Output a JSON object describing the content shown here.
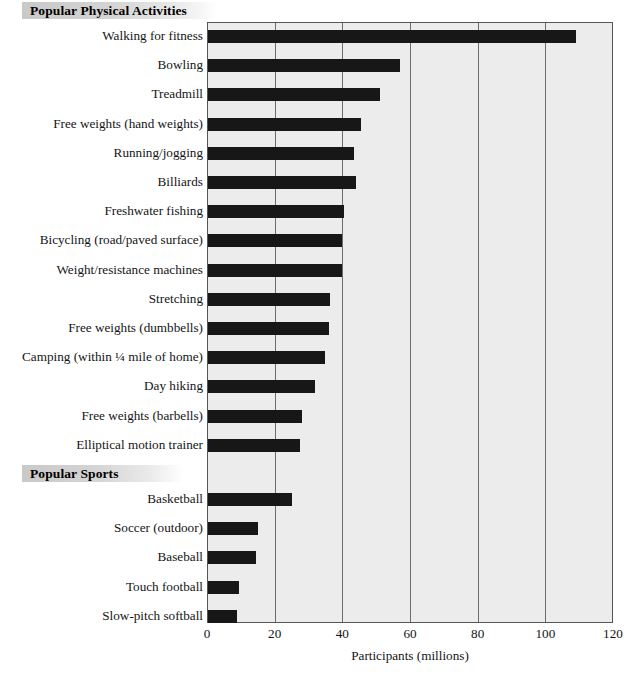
{
  "chart_data": {
    "type": "bar",
    "orientation": "horizontal",
    "title": "",
    "xlabel": "Participants (millions)",
    "ylabel": "",
    "xlim": [
      0,
      120
    ],
    "xticks": [
      0,
      20,
      40,
      60,
      80,
      100,
      120
    ],
    "xtick_labels": [
      "0",
      "20",
      "40",
      "60",
      "80",
      "100",
      "120"
    ],
    "grid": true,
    "grid_axis": "x",
    "legend": "none",
    "bar_color": "#171717",
    "plot_background": "#ececec",
    "sections": [
      {
        "name": "Popular Physical Activities",
        "categories": [
          "Walking for fitness",
          "Bowling",
          "Treadmill",
          "Free weights (hand weights)",
          "Running/jogging",
          "Billiards",
          "Freshwater fishing",
          "Bicycling (road/paved surface)",
          "Weight/resistance machines",
          "Stretching",
          "Free weights (dumbbells)",
          "Camping (within ¼ mile of home)",
          "Day hiking",
          "Free weights (barbells)",
          "Elliptical motion trainer"
        ],
        "values": [
          109,
          57,
          51,
          45.5,
          43.5,
          44,
          40.5,
          40,
          40,
          36.5,
          36,
          35,
          32,
          28,
          27.5
        ]
      },
      {
        "name": "Popular Sports",
        "categories": [
          "Basketball",
          "Soccer (outdoor)",
          "Baseball",
          "Touch football",
          "Slow-pitch softball"
        ],
        "values": [
          25,
          15,
          14.5,
          9.5,
          9
        ]
      }
    ]
  }
}
